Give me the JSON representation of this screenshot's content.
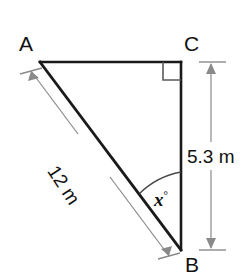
{
  "figure": {
    "type": "right-triangle-diagram",
    "vertices": {
      "a_label": "A",
      "b_label": "B",
      "c_label": "C"
    },
    "labels": {
      "hypotenuse": "12 m",
      "vertical_side": "5.3 m",
      "angle_value": "x",
      "angle_degree_symbol": "°"
    },
    "markers": {
      "right_angle_at": "C",
      "angle_x_at": "B"
    },
    "colors": {
      "stroke": "#1a1a1a",
      "dimension": "#8a8a8a",
      "text": "#111111",
      "background": "#ffffff"
    },
    "geometry": {
      "A": [
        40,
        62
      ],
      "B": [
        181,
        250
      ],
      "C": [
        181,
        62
      ],
      "right_angle_size": 18,
      "dimension_line_x": 211,
      "dimension_top_y": 62,
      "dimension_bottom_y": 250
    }
  }
}
